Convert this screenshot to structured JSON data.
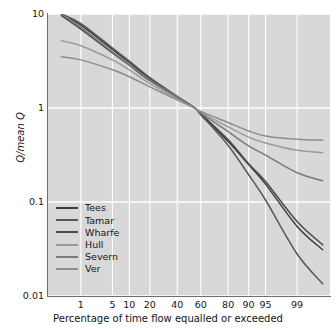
{
  "chart_data": {
    "type": "line",
    "title": "",
    "xlabel": "Percentage of time flow equalled or exceeded",
    "ylabel": "Q/mean Q",
    "ylabel_parts": {
      "italic_1": "Q",
      "plain": "/mean ",
      "italic_2": "Q"
    },
    "xscale": "probability",
    "yscale": "log",
    "ylim": [
      0.01,
      10
    ],
    "xlim": [
      0.1,
      99.9
    ],
    "grid": true,
    "grid_color": "#ffffff",
    "plot_background": "#d8d8d8",
    "legend_position": "lower-left-inside",
    "ytick_labels": [
      "10",
      "1",
      "0.1",
      "0.01"
    ],
    "ytick_values": [
      10,
      1,
      0.1,
      0.01
    ],
    "xtick_labels": [
      "1",
      "5",
      "10",
      "20",
      "40",
      "60",
      "80",
      "90",
      "95",
      "99"
    ],
    "xtick_values": [
      1,
      5,
      10,
      20,
      40,
      60,
      80,
      90,
      95,
      99
    ],
    "x": [
      0.3,
      1,
      5,
      10,
      20,
      40,
      55,
      60,
      80,
      90,
      95,
      99,
      99.8
    ],
    "series": [
      {
        "name": "Tees",
        "color": "#3d3d3d",
        "values": [
          10.0,
          7.6,
          4.2,
          3.05,
          2.05,
          1.32,
          1.0,
          0.86,
          0.44,
          0.25,
          0.155,
          0.055,
          0.031
        ]
      },
      {
        "name": "Tamar",
        "color": "#585858",
        "values": [
          10.0,
          7.9,
          4.35,
          3.15,
          2.1,
          1.33,
          1.0,
          0.85,
          0.4,
          0.195,
          0.105,
          0.028,
          0.0135
        ]
      },
      {
        "name": "Wharfe",
        "color": "#4a4a4a",
        "values": [
          9.6,
          6.9,
          3.85,
          2.85,
          1.95,
          1.3,
          1.0,
          0.87,
          0.46,
          0.255,
          0.165,
          0.062,
          0.035
        ]
      },
      {
        "name": "Hull",
        "color": "#9a9a9a",
        "values": [
          5.2,
          4.6,
          3.25,
          2.55,
          1.82,
          1.26,
          1.0,
          0.9,
          0.63,
          0.49,
          0.425,
          0.355,
          0.335
        ]
      },
      {
        "name": "Severn",
        "color": "#7a7a7a",
        "values": [
          10.0,
          7.2,
          3.95,
          2.9,
          1.98,
          1.31,
          1.0,
          0.88,
          0.56,
          0.395,
          0.315,
          0.205,
          0.168
        ]
      },
      {
        "name": "Ver",
        "color": "#8c8c8c",
        "values": [
          3.5,
          3.25,
          2.55,
          2.15,
          1.68,
          1.22,
          1.0,
          0.92,
          0.7,
          0.57,
          0.505,
          0.465,
          0.455
        ]
      }
    ]
  },
  "axes": {
    "ylabel_text": "Q/mean Q",
    "xlabel_text": "Percentage of time flow equalled or exceeded"
  },
  "legend": {
    "entries": [
      {
        "label": "Tees",
        "color": "#3d3d3d"
      },
      {
        "label": "Tamar",
        "color": "#585858"
      },
      {
        "label": "Wharfe",
        "color": "#4a4a4a"
      },
      {
        "label": "Hull",
        "color": "#9a9a9a"
      },
      {
        "label": "Severn",
        "color": "#7a7a7a"
      },
      {
        "label": "Ver",
        "color": "#8c8c8c"
      }
    ]
  }
}
